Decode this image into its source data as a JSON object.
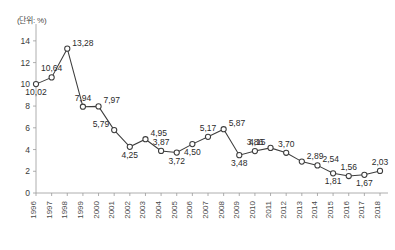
{
  "unit_label": "(단위: %)",
  "colors": {
    "line": "#3d3d3d",
    "marker_fill": "#ffffff",
    "axis": "#9a9a9a",
    "text": "#2b2b2b",
    "background": "#ffffff"
  },
  "chart_data": {
    "type": "line",
    "title": "",
    "subtitle": "",
    "xlabel": "",
    "ylabel": "(단위: %)",
    "unit": "%",
    "grid": false,
    "legend": "none",
    "xlim": [
      1996,
      2018
    ],
    "ylim": [
      0,
      15
    ],
    "yticks": [
      0,
      2,
      4,
      6,
      8,
      10,
      12,
      14
    ],
    "ytick_labels": [
      "0",
      "2",
      "4",
      "6",
      "8",
      "10",
      "12",
      "14"
    ],
    "categories": [
      "1996",
      "1997",
      "1998",
      "1999",
      "2000",
      "2001",
      "2002",
      "2003",
      "2004",
      "2005",
      "2006",
      "2007",
      "2008",
      "2009",
      "2010",
      "2011",
      "2012",
      "2013",
      "2014",
      "2015",
      "2016",
      "2017",
      "2018"
    ],
    "values": [
      10.02,
      10.64,
      13.28,
      7.94,
      7.97,
      5.79,
      4.25,
      4.95,
      3.87,
      3.72,
      4.5,
      5.17,
      5.87,
      3.48,
      3.86,
      4.15,
      3.7,
      2.89,
      2.54,
      1.81,
      1.56,
      1.67,
      2.03
    ],
    "point_labels": [
      "10,02",
      "10,64",
      "13,28",
      "7,94",
      "7,97",
      "5,79",
      "4,25",
      "4,95",
      "3,87",
      "3,72",
      "4,50",
      "5,17",
      "5,87",
      "3,48",
      "3,86",
      "4,15",
      "3,70",
      "2,89",
      "2,54",
      "1,81",
      "1,56",
      "1,67",
      "2,03"
    ],
    "label_positions": [
      "below",
      "above",
      "right",
      "above",
      "right",
      "left",
      "below",
      "right",
      "above",
      "below",
      "below",
      "above",
      "right",
      "below",
      "above",
      "left",
      "above",
      "right",
      "right",
      "below",
      "above",
      "below",
      "above"
    ]
  }
}
